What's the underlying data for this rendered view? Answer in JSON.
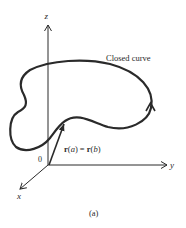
{
  "figure": {
    "caption": "(a)",
    "axes": {
      "z_label": "z",
      "y_label": "y",
      "x_label": "x",
      "origin_label": "0"
    },
    "curve_label": "Closed curve",
    "vector_label": {
      "lhs_fn": "r",
      "lhs_open": "(",
      "lhs_arg": "a",
      "lhs_close": ")",
      "eq": " = ",
      "rhs_fn": "r",
      "rhs_open": "(",
      "rhs_arg": "b",
      "rhs_close": ")"
    },
    "colors": {
      "stroke": "#2a2a2a",
      "background": "#ffffff"
    }
  }
}
